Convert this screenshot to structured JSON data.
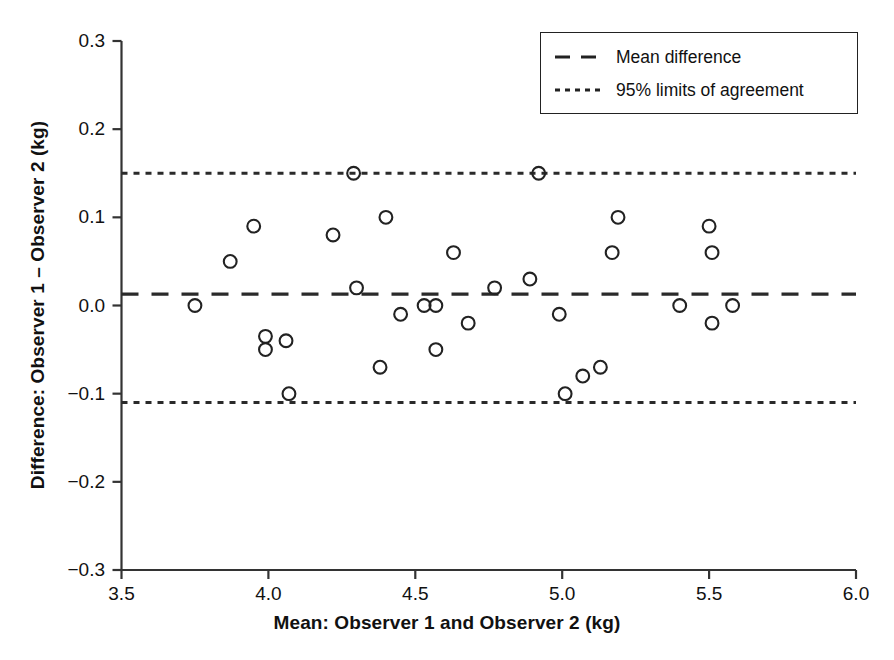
{
  "chart_data": {
    "type": "scatter",
    "title": "",
    "xlabel": "Mean: Observer 1 and Observer 2 (kg)",
    "ylabel": "Difference: Observer 1 – Observer 2 (kg)",
    "xlim": [
      3.5,
      6.0
    ],
    "ylim": [
      -0.3,
      0.3
    ],
    "xticks": [
      "3.5",
      "4.0",
      "4.5",
      "5.0",
      "5.5",
      "6.0"
    ],
    "xtick_values": [
      3.5,
      4.0,
      4.5,
      5.0,
      5.5,
      6.0
    ],
    "yticks": [
      "0.3",
      "0.2",
      "0.1",
      "0.0",
      "−0.1",
      "−0.2",
      "−0.3"
    ],
    "ytick_values": [
      0.3,
      0.2,
      0.1,
      0.0,
      -0.1,
      -0.2,
      -0.3
    ],
    "grid": false,
    "marker": "open-circle",
    "marker_color": "#222222",
    "legend_position": "top-right",
    "points": [
      {
        "x": 3.75,
        "y": 0.0
      },
      {
        "x": 3.87,
        "y": 0.05
      },
      {
        "x": 3.95,
        "y": 0.09
      },
      {
        "x": 3.99,
        "y": -0.035
      },
      {
        "x": 3.99,
        "y": -0.05
      },
      {
        "x": 4.06,
        "y": -0.04
      },
      {
        "x": 4.07,
        "y": -0.1
      },
      {
        "x": 4.22,
        "y": 0.08
      },
      {
        "x": 4.29,
        "y": 0.15
      },
      {
        "x": 4.3,
        "y": 0.02
      },
      {
        "x": 4.38,
        "y": -0.07
      },
      {
        "x": 4.4,
        "y": 0.1
      },
      {
        "x": 4.45,
        "y": -0.01
      },
      {
        "x": 4.53,
        "y": 0.0
      },
      {
        "x": 4.57,
        "y": 0.0
      },
      {
        "x": 4.57,
        "y": -0.05
      },
      {
        "x": 4.63,
        "y": 0.06
      },
      {
        "x": 4.68,
        "y": -0.02
      },
      {
        "x": 4.77,
        "y": 0.02
      },
      {
        "x": 4.89,
        "y": 0.03
      },
      {
        "x": 4.92,
        "y": 0.15
      },
      {
        "x": 4.99,
        "y": -0.01
      },
      {
        "x": 5.01,
        "y": -0.1
      },
      {
        "x": 5.07,
        "y": -0.08
      },
      {
        "x": 5.13,
        "y": -0.07
      },
      {
        "x": 5.17,
        "y": 0.06
      },
      {
        "x": 5.19,
        "y": 0.1
      },
      {
        "x": 5.4,
        "y": 0.0
      },
      {
        "x": 5.5,
        "y": 0.09
      },
      {
        "x": 5.51,
        "y": 0.06
      },
      {
        "x": 5.51,
        "y": -0.02
      },
      {
        "x": 5.58,
        "y": 0.0
      }
    ],
    "reference_lines": [
      {
        "name": "mean-difference",
        "value": 0.013,
        "style": "dashed"
      },
      {
        "name": "upper-limit-of-agreement",
        "value": 0.15,
        "style": "dotted"
      },
      {
        "name": "lower-limit-of-agreement",
        "value": -0.11,
        "style": "dotted"
      }
    ]
  },
  "legend": {
    "items": [
      {
        "label": "Mean difference",
        "style": "dashed"
      },
      {
        "label": "95% limits of agreement",
        "style": "dotted"
      }
    ]
  }
}
